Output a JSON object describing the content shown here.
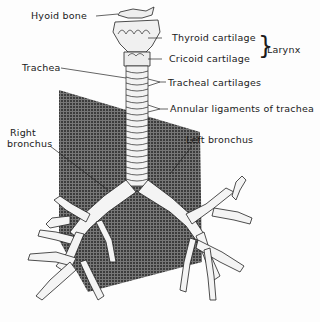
{
  "figure": {
    "labels": {
      "hyoid_bone": "Hyoid bone",
      "thyroid_cartilage": "Thyroid cartilage",
      "cricoid_cartilage": "Cricoid cartilage",
      "larynx": "Larynx",
      "trachea": "Trachea",
      "tracheal_cartilages": "Tracheal cartilages",
      "annular_ligaments": "Annular ligaments of trachea",
      "right_bronchus_line1": "Right",
      "right_bronchus_line2": "bronchus",
      "left_bronchus": "Left bronchus"
    },
    "colors": {
      "background": "#fdfdfd",
      "ink": "#1a1a1a",
      "plane_fill": "#4a4a4a",
      "structure_fill": "#f4f4f4"
    }
  }
}
